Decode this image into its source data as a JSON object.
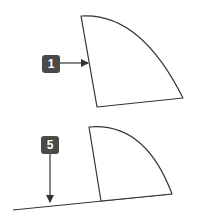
{
  "diagram": {
    "colors": {
      "stroke": "#333333",
      "label_bg": "#4a4a4a",
      "label_text": "#ffffff",
      "background": "#ffffff"
    },
    "panels": [
      {
        "id": "top",
        "callout": {
          "label": "1",
          "arrow_direction": "right"
        },
        "shape": "quarter-circle sector, straight left edge, curved right edge"
      },
      {
        "id": "bottom",
        "callout": {
          "label": "5",
          "arrow_direction": "down"
        },
        "shape": "quarter-circle sector resting on a sloped baseline line"
      }
    ]
  }
}
